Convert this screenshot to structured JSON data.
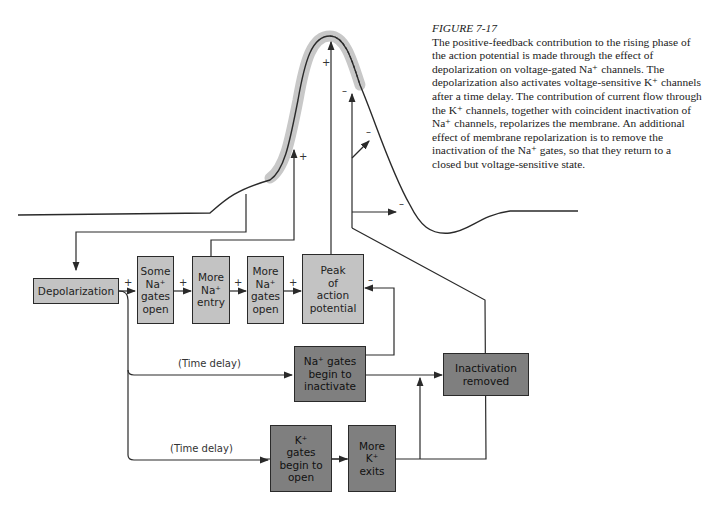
{
  "caption": {
    "figure_label": "FIGURE 7-17",
    "text": "The positive-feedback contribution to the rising phase of the action potential is made through the effect of depolarization on voltage-gated Na⁺ channels. The depolarization also activates voltage-sensitive K⁺ channels after a time delay. The contribution of current flow through the K⁺ channels, together with coincident inactivation of Na⁺ channels, repolarizes the membrane. An additional effect of membrane repolarization is to remove the inactivation of the Na⁺ gates, so that they return to a closed but voltage-sensitive state."
  },
  "boxes": {
    "depolarization": "Depolarization",
    "some_na_gates_open": [
      "Some",
      "Na⁺",
      "gates",
      "open"
    ],
    "more_na_entry": [
      "More",
      "Na⁺",
      "entry"
    ],
    "more_na_gates_open": [
      "More",
      "Na⁺",
      "gates",
      "open"
    ],
    "peak": [
      "Peak",
      "of",
      "action",
      "potential"
    ],
    "na_gates_inactivate": [
      "Na⁺ gates",
      "begin to",
      "inactivate"
    ],
    "inactivation_removed": [
      "Inactivation",
      "removed"
    ],
    "k_gates_open": [
      "K⁺",
      "gates",
      "begin to",
      "open"
    ],
    "more_k_exits": [
      "More",
      "K⁺",
      "exits"
    ]
  },
  "labels": {
    "time_delay_1": "(Time delay)",
    "time_delay_2": "(Time delay)"
  },
  "signs": {
    "plus": "+",
    "minus": "–"
  },
  "colors": {
    "light_box": "#c3c3c3",
    "dark_box": "#7f7f7f",
    "highlight": "#c8c8c8",
    "line": "#2a2a2a"
  }
}
